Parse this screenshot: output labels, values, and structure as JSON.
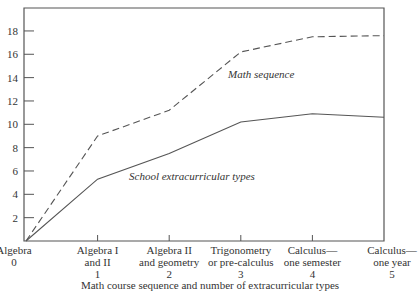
{
  "chart_data": {
    "type": "line",
    "title": "",
    "xlabel": "Math course sequence and number of extracurricular types",
    "ylabel": "",
    "ylim": [
      0,
      20
    ],
    "yticks": [
      2,
      4,
      6,
      8,
      10,
      12,
      14,
      16,
      18
    ],
    "grid": false,
    "legend": "inline labels",
    "x": [
      0,
      1,
      2,
      3,
      4,
      5
    ],
    "categories": [
      [
        "Algebra",
        "0"
      ],
      [
        "Algebra I",
        "and II",
        "1"
      ],
      [
        "Algebra II",
        "and geometry",
        "2"
      ],
      [
        "Trigonometry",
        "or pre-calculus",
        "3"
      ],
      [
        "Calculus—",
        "one semester",
        "4"
      ],
      [
        "Calculus—",
        "one year",
        "5"
      ]
    ],
    "series": [
      {
        "name": "Math sequence",
        "style": "dashed",
        "values": [
          0,
          9.0,
          11.2,
          16.2,
          17.5,
          17.6
        ]
      },
      {
        "name": "School extracurricular types",
        "style": "solid",
        "values": [
          0,
          5.3,
          7.5,
          10.2,
          10.9,
          10.6
        ]
      }
    ]
  },
  "colors": {
    "line": "#555555",
    "frame": "#555555",
    "text": "#333333"
  }
}
